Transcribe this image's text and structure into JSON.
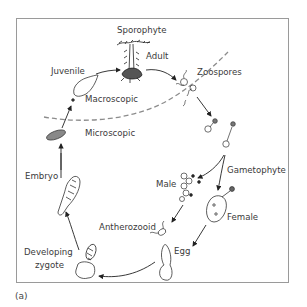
{
  "figure": {
    "panel_label": "(a)"
  },
  "labels": {
    "sporophyte": "Sporophyte",
    "adult": "Adult",
    "zoospores": "Zoospores",
    "juvenile": "Juvenile",
    "macroscopic": "Macroscopic",
    "microscopic": "Microscopic",
    "gametophyte": "Gametophyte",
    "male": "Male",
    "female": "Female",
    "antherozooid": "Antherozooid",
    "egg": "Egg",
    "embryo": "Embryo",
    "developing_zygote_line1": "Developing",
    "developing_zygote_line2": "zygote"
  },
  "cycle_order": [
    "Adult",
    "Zoospores",
    "Gametophyte",
    "Male",
    "Female",
    "Antherozooid",
    "Egg",
    "Developing zygote",
    "Embryo",
    "Microscopic",
    "Juvenile",
    "Adult"
  ],
  "colors": {
    "line": "#333333",
    "dashed_boundary": "#8c8c8c",
    "frame": "#9a9a9a"
  }
}
